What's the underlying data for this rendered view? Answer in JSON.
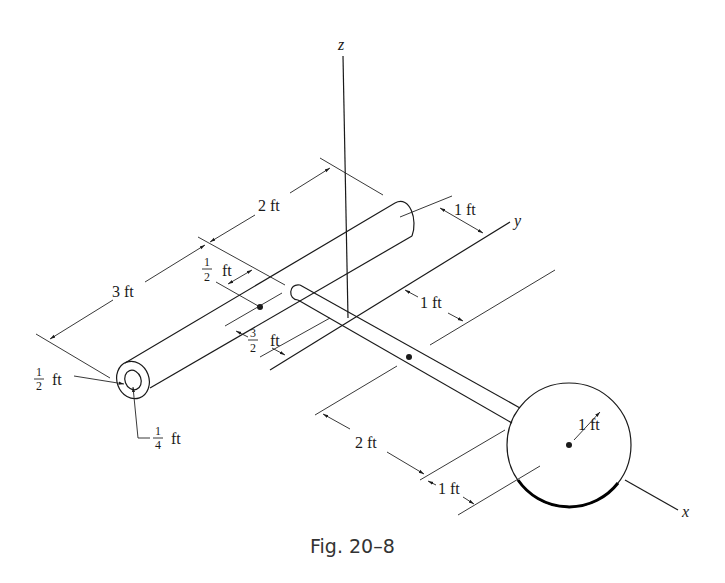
{
  "figure": {
    "caption": "Fig. 20–8",
    "axes": {
      "x": "x",
      "y": "y",
      "z": "z"
    },
    "dimensions": {
      "tube_length": "3 ft",
      "tube_to_yaxis": "2 ft",
      "tube_outer_radius_num": "1",
      "tube_outer_radius_den": "2",
      "tube_outer_radius_unit": "ft",
      "tube_inner_radius_num": "1",
      "tube_inner_radius_den": "4",
      "tube_inner_radius_unit": "ft",
      "tube_cg_offset_num": "1",
      "tube_cg_offset_den": "2",
      "tube_cg_offset_unit": "ft",
      "tube_lateral_num": "3",
      "tube_lateral_den": "2",
      "tube_lateral_unit": "ft",
      "tube_to_yaxis_offset": "1 ft",
      "rod_offset": "1 ft",
      "rod_length": "2 ft",
      "disk_offset": "1 ft",
      "disk_radius": "1 ft"
    }
  }
}
